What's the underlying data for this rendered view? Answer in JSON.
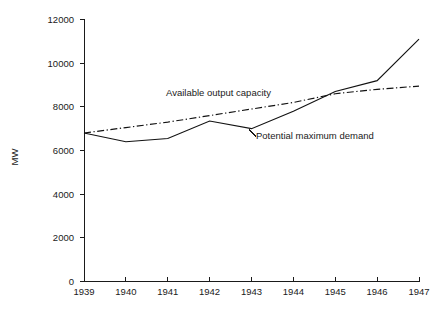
{
  "chart_data": {
    "type": "line",
    "title": "",
    "xlabel": "",
    "ylabel": "MW",
    "categories": [
      "1939",
      "1940",
      "1941",
      "1942",
      "1943",
      "1944",
      "1945",
      "1946",
      "1947"
    ],
    "x": [
      1939,
      1940,
      1941,
      1942,
      1943,
      1944,
      1945,
      1946,
      1947
    ],
    "xlim": [
      1939,
      1947
    ],
    "ylim": [
      0,
      12000
    ],
    "ytick_labels": [
      "0",
      "2000",
      "4000",
      "6000",
      "8000",
      "10000",
      "12000"
    ],
    "yticks": [
      0,
      2000,
      4000,
      6000,
      8000,
      10000,
      12000
    ],
    "grid": false,
    "legend": "inline-annotations",
    "series": [
      {
        "name": "Available output capacity",
        "style": "dash-dot",
        "color": "#121212",
        "values": [
          6800,
          7050,
          7300,
          7600,
          7900,
          8200,
          8600,
          8800,
          8950
        ]
      },
      {
        "name": "Potential maximum demand",
        "style": "solid",
        "color": "#121212",
        "values": [
          6800,
          6400,
          6550,
          7350,
          7000,
          7800,
          8700,
          9200,
          11100
        ]
      }
    ],
    "annotations": [
      {
        "text": "Available output capacity",
        "x": 1941.95,
        "y": 9050
      },
      {
        "text": "Potential maximum demand",
        "x": 1944.05,
        "y": 6720
      }
    ]
  }
}
